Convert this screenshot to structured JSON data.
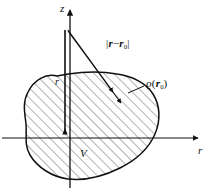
{
  "figure": {
    "kind": "physics-diagram",
    "background_color": "#ffffff",
    "ink_color": "#111111",
    "hatch_color": "#444444"
  },
  "axes": {
    "vertical": {
      "name": "z-axis",
      "label": "z",
      "arrow": "up"
    },
    "horizontal": {
      "name": "r-axis",
      "label": "r",
      "arrow": "right"
    },
    "origin_label": ""
  },
  "labels": {
    "distance": {
      "prefix": "|",
      "vector_a": "r",
      "minus": "−",
      "vector_b": "r",
      "subscript_b": "0",
      "suffix": "|"
    },
    "density": {
      "symbol": "ϱ",
      "open_paren": "(",
      "vector": "r",
      "subscript": "0",
      "close_paren": ")"
    },
    "volume": "V",
    "position_vector": "r"
  },
  "shapes": {
    "blob": {
      "name": "volume-region",
      "fill": "#ffffff",
      "stroke": "#111111",
      "hatched": true,
      "hatch_angle_deg": 45
    },
    "vectors": [
      {
        "name": "distance-vector-upper",
        "from": "z-axis-apex",
        "to": "source-point",
        "arrowhead": true
      },
      {
        "name": "distance-vector-lower",
        "from": "z-axis-apex",
        "to": "source-point-offset",
        "arrowhead": true
      },
      {
        "name": "position-vector-r",
        "from": "origin",
        "to": "field-point",
        "arrowhead": true
      }
    ],
    "leader_lines": [
      {
        "name": "density-leader-line",
        "from": "density-label",
        "to": "blob-edge"
      }
    ]
  }
}
